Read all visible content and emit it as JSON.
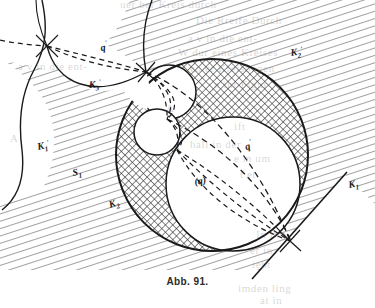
{
  "figure": {
    "caption": "Abb. 91.",
    "title": "Abb. 91.",
    "kind": "geometric-diagram",
    "colors": {
      "ink": "#1a1a1a",
      "paper": "#ffffff",
      "hatch": "#4a4a4a",
      "crosshatch": "#3a3a3a",
      "ghost_text": "#787673"
    }
  },
  "labels": {
    "k1": {
      "base": "K",
      "sub": "1",
      "prime": "",
      "x": 349,
      "y": 188
    },
    "k2": {
      "base": "K",
      "sub": "2",
      "prime": "",
      "x": 112,
      "y": 208
    },
    "k1p": {
      "base": "K",
      "sub": "1",
      "prime": "'",
      "x": 41,
      "y": 150
    },
    "k2p": {
      "base": "K",
      "sub": "2",
      "prime": "'",
      "x": 293,
      "y": 55
    },
    "k3p": {
      "base": "K",
      "sub": "3",
      "prime": "'",
      "x": 92,
      "y": 87
    },
    "s1": {
      "base": "S",
      "sub": "1",
      "prime": "",
      "x": 76,
      "y": 175
    },
    "q": {
      "base": "q",
      "sub": "",
      "prime": "",
      "x": 248,
      "y": 148
    },
    "qp": {
      "base": "q",
      "sub": "",
      "prime": "'",
      "x": 104,
      "y": 50
    },
    "qpar": {
      "base": "(q)",
      "sub": "",
      "prime": "",
      "x": 199,
      "y": 183
    }
  },
  "label_text": {
    "k1": "K₁",
    "k2": "K₂",
    "k1p": "K′₁",
    "k2p": "K′₂",
    "k3p": "K′₃",
    "s1": "S₁",
    "q": "q",
    "qp": "q′",
    "qpar": "(q)"
  },
  "geometry": {
    "big_circle": {
      "cx": 212,
      "cy": 155,
      "r": 96,
      "name": "K2-outer-circle"
    },
    "inner_big_circle": {
      "cx": 233,
      "cy": 184,
      "r": 67,
      "name": "largest-chain-circle"
    },
    "chain_circles": [
      {
        "cx": 169,
        "cy": 92,
        "r": 27
      },
      {
        "cx": 157,
        "cy": 132,
        "r": 23
      }
    ],
    "tangency_points": [
      {
        "x": 146,
        "y": 72,
        "name": "upper-tangency-node"
      },
      {
        "x": 167,
        "y": 119,
        "name": "middle-tangency-node"
      },
      {
        "x": 290,
        "y": 241,
        "name": "lower-right-tangency-node"
      },
      {
        "x": 47,
        "y": 46,
        "name": "left-outer-node"
      }
    ],
    "tangent_line_k1": {
      "x1": 254,
      "y1": 277,
      "x2": 345,
      "y2": 175
    }
  },
  "bleed_through_text": [
    {
      "t": "uer ber  Kreis durch",
      "x": 120,
      "y": 2
    },
    {
      "t": "Die Rreife Durch",
      "x": 196,
      "y": 22
    },
    {
      "t": "a v in die ent-",
      "x": 188,
      "y": 40
    },
    {
      "t": "W dur  eines  Kreises",
      "x": 178,
      "y": 54
    },
    {
      "t": "en  er   Kreisbogen",
      "x": 190,
      "y": 70
    },
    {
      "t": "n ihr Figur",
      "x": 210,
      "y": 86
    },
    {
      "t": "A",
      "x": 165,
      "y": 110
    },
    {
      "t": "ift",
      "x": 232,
      "y": 128
    },
    {
      "t": "hall  in   der",
      "x": 188,
      "y": 146
    },
    {
      "t": "e m  um",
      "x": 230,
      "y": 160
    },
    {
      "t": "t  et",
      "x": 236,
      "y": 176
    },
    {
      "t": "In  ihn",
      "x": 254,
      "y": 236
    },
    {
      "t": "er in",
      "x": 248,
      "y": 252
    },
    {
      "t": "iebt",
      "x": 250,
      "y": 266
    },
    {
      "t": "imden ling",
      "x": 236,
      "y": 288
    },
    {
      "t": "at  in",
      "x": 258,
      "y": 300
    }
  ]
}
